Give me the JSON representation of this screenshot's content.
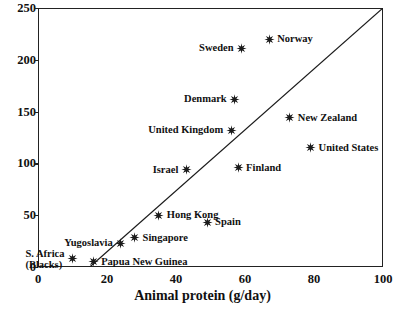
{
  "chart_data": {
    "type": "scatter",
    "title": "",
    "xlabel": "Animal protein (g/day)",
    "ylabel": "",
    "xlim": [
      0,
      100
    ],
    "ylim": [
      0,
      250
    ],
    "xticks": [
      0,
      20,
      40,
      60,
      80,
      100
    ],
    "yticks": [
      0,
      50,
      100,
      150,
      200,
      250
    ],
    "grid": false,
    "legend": "none",
    "marker_style": "six-pointed-star",
    "marker_color": "#1a1a1a",
    "reference_line": {
      "label": "",
      "x": [
        15,
        100
      ],
      "y": [
        0,
        250
      ],
      "color": "#1a1a1a"
    },
    "points": [
      {
        "name": "Norway",
        "x": 67,
        "y": 220,
        "label_side": "right"
      },
      {
        "name": "Sweden",
        "x": 59,
        "y": 211,
        "label_side": "left"
      },
      {
        "name": "Denmark",
        "x": 57,
        "y": 162,
        "label_side": "left"
      },
      {
        "name": "New Zealand",
        "x": 73,
        "y": 144,
        "label_side": "right"
      },
      {
        "name": "United Kingdom",
        "x": 56,
        "y": 132,
        "label_side": "left"
      },
      {
        "name": "United States",
        "x": 79,
        "y": 115,
        "label_side": "right"
      },
      {
        "name": "Finland",
        "x": 58,
        "y": 96,
        "label_side": "right"
      },
      {
        "name": "Israel",
        "x": 43,
        "y": 94,
        "label_side": "left"
      },
      {
        "name": "Hong Kong",
        "x": 35,
        "y": 50,
        "label_side": "right"
      },
      {
        "name": "Spain",
        "x": 49,
        "y": 43,
        "label_side": "right"
      },
      {
        "name": "Singapore",
        "x": 28,
        "y": 28,
        "label_side": "right"
      },
      {
        "name": "Yugoslavia",
        "x": 24,
        "y": 23,
        "label_side": "left"
      },
      {
        "name": "S. Africa\n(Blacks)",
        "x": 10,
        "y": 8,
        "label_side": "left"
      },
      {
        "name": "Papua New Guinea",
        "x": 16,
        "y": 5,
        "label_side": "right"
      }
    ]
  }
}
